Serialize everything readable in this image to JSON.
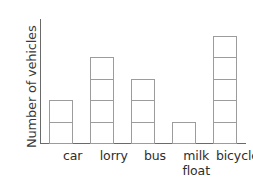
{
  "chart_data": {
    "type": "bar",
    "title": "",
    "subtitle": "",
    "xlabel": "",
    "ylabel": "Number of vehicles",
    "categories": [
      "car",
      "lorry",
      "bus",
      "milk float",
      "bicycle"
    ],
    "values": [
      2,
      4,
      3,
      1,
      5
    ],
    "ylim": [
      0,
      5.5
    ],
    "grid": false,
    "legend": null,
    "tick_labels_y": []
  },
  "axis": {
    "y_title": "Number of vehicles"
  },
  "categories": [
    {
      "id": "car",
      "lines": [
        "car"
      ],
      "value": 2
    },
    {
      "id": "lorry",
      "lines": [
        "lorry"
      ],
      "value": 4
    },
    {
      "id": "bus",
      "lines": [
        "bus"
      ],
      "value": 3
    },
    {
      "id": "milk-float",
      "lines": [
        "milk",
        "float"
      ],
      "value": 1
    },
    {
      "id": "bicycle",
      "lines": [
        "bicycle"
      ],
      "value": 5
    }
  ],
  "colors": {
    "background": "#ffffff",
    "axis": "#6a6a6a",
    "bar_outline": "#9c9c9c",
    "label_text": "#2e2e2e",
    "axis_title_text": "#3a3a3a"
  }
}
